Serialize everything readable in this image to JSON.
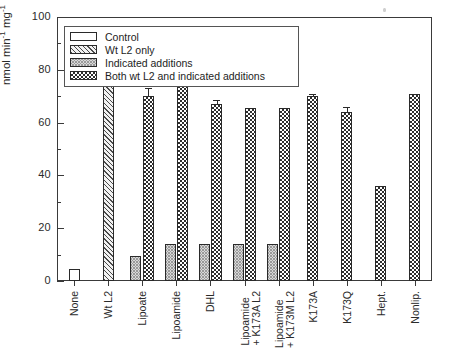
{
  "chart_data": {
    "type": "bar",
    "title": "",
    "xlabel": "",
    "ylabel": "nmol min⁻¹ mg⁻¹",
    "ylabel_parts": {
      "base1": "nmol min",
      "sup1": "-1",
      "base2": " mg",
      "sup2": "-1"
    },
    "ylim": [
      0,
      100
    ],
    "ytick_major": [
      0,
      20,
      40,
      60,
      80,
      100
    ],
    "ytick_minor": [
      10,
      30,
      50,
      70,
      90
    ],
    "grid": false,
    "legend_position": "upper-left-inside",
    "categories": [
      "None",
      "Wt L2",
      "Lipoate",
      "Lipoamide",
      "DHL",
      "Lipoamide|+ K173A L2",
      "Lipoamide|+ K173M L2",
      "K173A",
      "K173Q",
      "Hept.",
      "Nonlip."
    ],
    "series": [
      {
        "name": "Control",
        "pattern": "open-white",
        "values": [
          4.5,
          null,
          null,
          null,
          null,
          null,
          null,
          null,
          null,
          null,
          null
        ],
        "errors": [
          null,
          null,
          null,
          null,
          null,
          null,
          null,
          null,
          null,
          null,
          null
        ]
      },
      {
        "name": "Wt L2 only",
        "pattern": "diagonal-hatch",
        "values": [
          null,
          80,
          null,
          null,
          null,
          null,
          null,
          null,
          null,
          null,
          null
        ],
        "errors": [
          null,
          0.8,
          null,
          null,
          null,
          null,
          null,
          null,
          null,
          null,
          null
        ]
      },
      {
        "name": "Indicated additions",
        "pattern": "fine-crosshatch-gray",
        "values": [
          null,
          null,
          9.5,
          14,
          14,
          14,
          14,
          null,
          null,
          null,
          null
        ],
        "errors": [
          null,
          null,
          null,
          null,
          null,
          null,
          null,
          null,
          null,
          null,
          null
        ]
      },
      {
        "name": "Both wt L2 and indicated additions",
        "pattern": "checkerboard",
        "values": [
          null,
          null,
          70,
          81,
          67,
          65.5,
          65.5,
          70,
          64,
          36,
          71
        ],
        "errors": [
          null,
          null,
          3.0,
          1.5,
          1.5,
          null,
          null,
          0.8,
          2.0,
          null,
          null
        ]
      }
    ]
  },
  "legend": {
    "items": [
      {
        "label": "Control"
      },
      {
        "label": "Wt L2 only"
      },
      {
        "label": "Indicated additions"
      },
      {
        "label": "Both wt L2 and indicated additions"
      }
    ]
  }
}
